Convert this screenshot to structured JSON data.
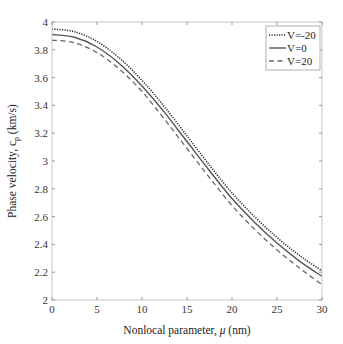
{
  "chart_data": {
    "type": "line",
    "title": "",
    "xlabel": "Nonlocal parameter, μ (nm)",
    "ylabel": "Phase velocity, c_p (km/s)",
    "xlim": [
      0,
      30
    ],
    "ylim": [
      2,
      4
    ],
    "xticks": [
      0,
      5,
      10,
      15,
      20,
      25,
      30
    ],
    "yticks": [
      2,
      2.2,
      2.4,
      2.6,
      2.8,
      3,
      3.2,
      3.4,
      3.6,
      3.8,
      4
    ],
    "grid": false,
    "legend_position": "upper right",
    "x": [
      0,
      2.5,
      5,
      7.5,
      10,
      12.5,
      15,
      17.5,
      20,
      22.5,
      25,
      27.5,
      30
    ],
    "series": [
      {
        "name": "V=-20",
        "style": "dotted",
        "color": "#333333",
        "values": [
          3.95,
          3.93,
          3.86,
          3.74,
          3.58,
          3.39,
          3.18,
          2.97,
          2.77,
          2.6,
          2.45,
          2.32,
          2.21
        ]
      },
      {
        "name": "V=0",
        "style": "solid",
        "color": "#555555",
        "values": [
          3.91,
          3.89,
          3.82,
          3.7,
          3.54,
          3.35,
          3.14,
          2.93,
          2.73,
          2.56,
          2.41,
          2.28,
          2.17
        ]
      },
      {
        "name": "V=20",
        "style": "dashed",
        "color": "#666666",
        "values": [
          3.87,
          3.85,
          3.78,
          3.66,
          3.5,
          3.3,
          3.09,
          2.88,
          2.68,
          2.51,
          2.36,
          2.23,
          2.11
        ]
      }
    ]
  },
  "labels": {
    "xlabel_prefix": "Nonlocal parameter, ",
    "xlabel_mu": "μ",
    "xlabel_suffix": " (nm)",
    "ylabel_main": "Phase velocity, c",
    "ylabel_sub": "p",
    "ylabel_suffix": " (km/s)"
  }
}
